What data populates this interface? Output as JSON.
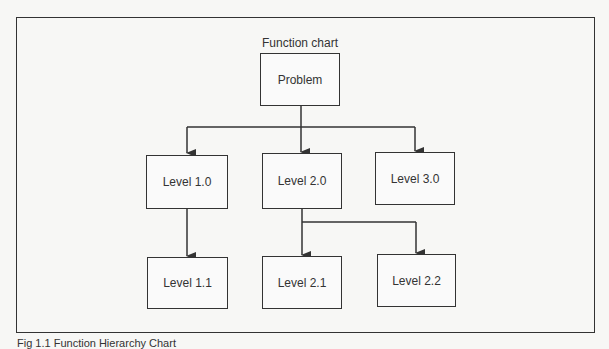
{
  "diagram": {
    "title": "Function chart",
    "caption": "Fig 1.1 Function Hierarchy Chart",
    "nodes": {
      "problem": "Problem",
      "level_1_0": "Level 1.0",
      "level_2_0": "Level 2.0",
      "level_3_0": "Level 3.0",
      "level_1_1": "Level 1.1",
      "level_2_1": "Level 2.1",
      "level_2_2": "Level 2.2"
    },
    "edges": [
      [
        "Problem",
        "Level 1.0"
      ],
      [
        "Problem",
        "Level 2.0"
      ],
      [
        "Problem",
        "Level 3.0"
      ],
      [
        "Level 1.0",
        "Level 1.1"
      ],
      [
        "Level 2.0",
        "Level 2.1"
      ],
      [
        "Level 2.0",
        "Level 2.2"
      ]
    ]
  }
}
